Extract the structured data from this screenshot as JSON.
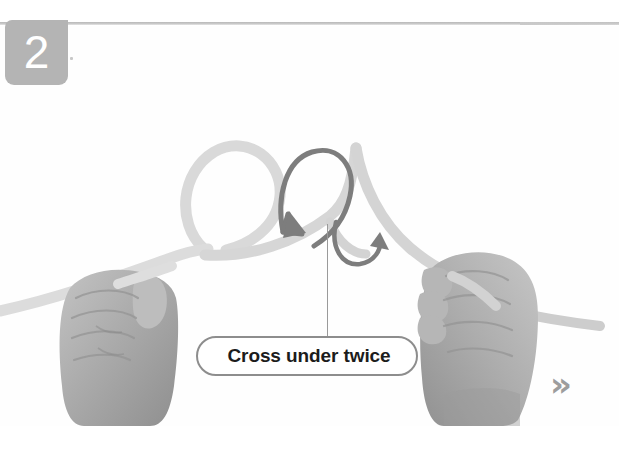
{
  "page": {
    "background_color": "#ffffff",
    "content_background_color": "#fefefe",
    "width": 619,
    "height": 450
  },
  "step_badge": {
    "number": "2",
    "background_color": "#b4b4b4",
    "text_color": "#ffffff",
    "name": "step-number-badge"
  },
  "divider": {
    "color": "#c9c9c9"
  },
  "caption": {
    "text": "Cross under twice",
    "border_color": "#8d8d8d",
    "text_color": "#1c1c1c",
    "background_color": "#ffffff"
  },
  "leader_line": {
    "color": "#9a9a9a"
  },
  "next_indicator": {
    "glyph": "»",
    "color": "#9d9d9d",
    "name": "next-chevron-icon"
  },
  "illustration": {
    "type": "photo-diagram",
    "subject": "two hands tying a rope knot",
    "rope_color": "#d8d8d8",
    "rope_shadow_color": "#bfbfbf",
    "hand_color": "#a8a8a8",
    "arrow_color": "#7a7a7a",
    "arrows": [
      {
        "name": "cross-under-arrow-1",
        "direction": "down",
        "shape": "large-hook"
      },
      {
        "name": "cross-under-arrow-2",
        "direction": "up-right",
        "shape": "small-u-turn"
      }
    ],
    "hands": [
      {
        "name": "left-hand",
        "grip": "holding rope end"
      },
      {
        "name": "right-hand",
        "grip": "holding rope end"
      }
    ]
  }
}
